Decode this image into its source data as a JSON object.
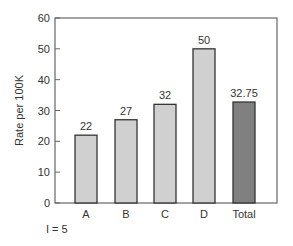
{
  "chart_data": {
    "type": "bar",
    "title": "",
    "xlabel": "",
    "ylabel": "Rate per 100K",
    "ylim": [
      0,
      60
    ],
    "yticks": [
      0,
      10,
      20,
      30,
      40,
      50,
      60
    ],
    "categories": [
      "A",
      "B",
      "C",
      "D",
      "Total"
    ],
    "values": [
      22,
      27,
      32,
      50,
      32.75
    ],
    "data_labels": [
      "22",
      "27",
      "32",
      "50",
      "32.75"
    ],
    "colors": [
      "#d0d0d0",
      "#d0d0d0",
      "#d0d0d0",
      "#d0d0d0",
      "#808080"
    ],
    "grid": false,
    "legend": null
  },
  "footnote": "I = 5"
}
